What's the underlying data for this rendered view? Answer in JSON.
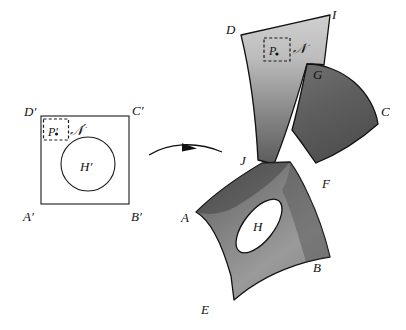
{
  "figure": {
    "type": "mathematical-diagram",
    "background_color": "#ffffff",
    "ink_color": "#111111"
  },
  "reference": {
    "name": "reference-configuration",
    "shape": "square",
    "corner_labels": {
      "top_left": "D′",
      "top_right": "C′",
      "bottom_left": "A′",
      "bottom_right": "B′"
    },
    "hole_label": "H′",
    "neighborhood_label": "𝒩′",
    "point_label": "P′",
    "hole_shape": "circle",
    "point_box_shape": "dashed-square",
    "fill_color": "#ffffff",
    "stroke_color": "#1a1a1a"
  },
  "deformed": {
    "name": "deformed-configuration",
    "shape": "curved-polygon",
    "vertex_labels": [
      "A",
      "B",
      "C",
      "D",
      "E",
      "F",
      "G",
      "I",
      "J"
    ],
    "hole_label": "H",
    "neighborhood_label": "𝒩",
    "point_label": "P",
    "hole_shape": "tilted-ellipse",
    "point_box_shape": "dashed-square",
    "shading": "vertical-gradient",
    "gradient_light": "#c9c9c9",
    "gradient_mid": "#9a9a9a",
    "gradient_dark": "#565656",
    "stroke_color": "#111111"
  },
  "arrow": {
    "name": "mapping-arrow",
    "style": "curved",
    "direction": "left-to-right",
    "label": ""
  },
  "labels": {
    "A": "A",
    "B": "B",
    "C": "C",
    "D": "D",
    "E": "E",
    "F": "F",
    "G": "G",
    "H": "H",
    "I": "I",
    "J": "J",
    "P": "P",
    "N": "𝒩",
    "A_prime": "A′",
    "B_prime": "B′",
    "C_prime": "C′",
    "D_prime": "D′",
    "H_prime": "H′",
    "P_prime": "P′",
    "N_prime": "𝒩′"
  }
}
